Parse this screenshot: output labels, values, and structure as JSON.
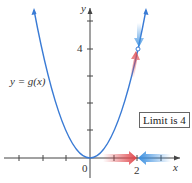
{
  "figure": {
    "function_label": "y = g(x)",
    "x_axis_label": "x",
    "y_axis_label": "y",
    "origin_label": "0",
    "x_tick_label": "2",
    "y_tick_label": "4",
    "annotation": "Limit is 4",
    "colors": {
      "curve": "#3a7bd5",
      "left_arrow": "#e0474c",
      "right_arrow": "#3a8fe0",
      "axis": "#444444"
    }
  }
}
